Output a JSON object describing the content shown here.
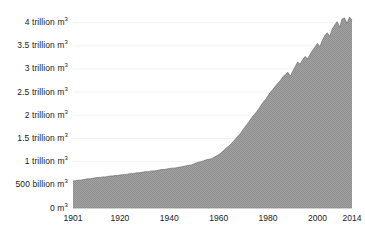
{
  "chart_data": {
    "type": "area",
    "title": "",
    "subtitle": "",
    "xlabel": "",
    "ylabel": "",
    "unit": "m3",
    "grid": true,
    "legend_position": "none",
    "xlim": [
      1901,
      2014
    ],
    "ylim": [
      0,
      4250000000000
    ],
    "y_tick_values": [
      0,
      500000000000,
      1000000000000,
      1500000000000,
      2000000000000,
      2500000000000,
      3000000000000,
      3500000000000,
      4000000000000
    ],
    "y_tick_labels": [
      "0 m",
      "500 billion m",
      "1 trillion m",
      "1.5 trillion m",
      "2 trillion m",
      "2.5 trillion m",
      "3 trillion m",
      "3.5 trillion m",
      "4 trillion m"
    ],
    "y_tick_superscript": "3",
    "x_tick_labels": [
      "1901",
      "1920",
      "1940",
      "1960",
      "1980",
      "2000",
      "2014"
    ],
    "x_tick_values": [
      1901,
      1920,
      1940,
      1960,
      1980,
      2000,
      2014
    ],
    "series_name": "Global water withdrawal",
    "fill_color": "#9a9a9a",
    "line_color": "#6f6f6f",
    "grid_color": "#ededed",
    "axis_color": "#8c8c8c",
    "text_color": "#1b1b1b",
    "background_color": "#ffffff",
    "x": [
      1901,
      1902,
      1903,
      1904,
      1905,
      1906,
      1907,
      1908,
      1909,
      1910,
      1911,
      1912,
      1913,
      1914,
      1915,
      1916,
      1917,
      1918,
      1919,
      1920,
      1921,
      1922,
      1923,
      1924,
      1925,
      1926,
      1927,
      1928,
      1929,
      1930,
      1931,
      1932,
      1933,
      1934,
      1935,
      1936,
      1937,
      1938,
      1939,
      1940,
      1941,
      1942,
      1943,
      1944,
      1945,
      1946,
      1947,
      1948,
      1949,
      1950,
      1951,
      1952,
      1953,
      1954,
      1955,
      1956,
      1957,
      1958,
      1959,
      1960,
      1961,
      1962,
      1963,
      1964,
      1965,
      1966,
      1967,
      1968,
      1969,
      1970,
      1971,
      1972,
      1973,
      1974,
      1975,
      1976,
      1977,
      1978,
      1979,
      1980,
      1981,
      1982,
      1983,
      1984,
      1985,
      1986,
      1987,
      1988,
      1989,
      1990,
      1991,
      1992,
      1993,
      1994,
      1995,
      1996,
      1997,
      1998,
      1999,
      2000,
      2001,
      2002,
      2003,
      2004,
      2005,
      2006,
      2007,
      2008,
      2009,
      2010,
      2011,
      2012,
      2013,
      2014
    ],
    "values_trillion_m3": [
      0.58,
      0.59,
      0.6,
      0.6,
      0.61,
      0.62,
      0.63,
      0.63,
      0.64,
      0.65,
      0.66,
      0.66,
      0.67,
      0.67,
      0.68,
      0.69,
      0.69,
      0.7,
      0.7,
      0.71,
      0.72,
      0.72,
      0.73,
      0.74,
      0.74,
      0.75,
      0.76,
      0.76,
      0.77,
      0.78,
      0.78,
      0.79,
      0.8,
      0.8,
      0.81,
      0.82,
      0.83,
      0.83,
      0.84,
      0.85,
      0.86,
      0.86,
      0.87,
      0.88,
      0.89,
      0.9,
      0.91,
      0.92,
      0.93,
      0.95,
      0.97,
      0.99,
      1.0,
      1.02,
      1.04,
      1.05,
      1.06,
      1.09,
      1.12,
      1.15,
      1.19,
      1.24,
      1.29,
      1.33,
      1.38,
      1.44,
      1.5,
      1.56,
      1.62,
      1.7,
      1.77,
      1.84,
      1.92,
      1.99,
      2.05,
      2.12,
      2.2,
      2.28,
      2.34,
      2.42,
      2.5,
      2.56,
      2.63,
      2.69,
      2.75,
      2.83,
      2.88,
      2.93,
      2.84,
      2.95,
      3.05,
      3.15,
      3.1,
      3.2,
      3.27,
      3.22,
      3.31,
      3.4,
      3.47,
      3.55,
      3.48,
      3.62,
      3.72,
      3.78,
      3.7,
      3.86,
      3.95,
      4.02,
      3.9,
      4.08,
      4.1,
      3.98,
      4.12,
      4.05
    ]
  },
  "axes": {
    "plot_left_px": 73,
    "plot_right_px": 352,
    "plot_top_px": 11,
    "plot_bottom_px": 208
  }
}
